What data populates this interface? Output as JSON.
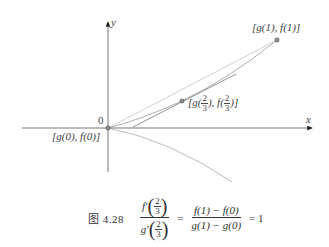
{
  "figure": {
    "axes": {
      "x_label": "x",
      "y_label": "y",
      "origin_label": "0"
    },
    "points": [
      {
        "id": "start",
        "label_prefix": "[g(0), f(0)]",
        "text": "[g(0), f(0)]",
        "px": [
          108,
          128
        ]
      },
      {
        "id": "mid",
        "text_parts": {
          "open": "[g(",
          "mid": "), f(",
          "close": ")]",
          "frac_num": "2",
          "frac_den": "3"
        },
        "px": [
          182,
          101
        ]
      },
      {
        "id": "end",
        "text": "[g(1), f(1)]",
        "px": [
          277,
          40
        ]
      }
    ],
    "curves": [
      {
        "name": "parametric-curve-upper",
        "color": "#888888"
      },
      {
        "name": "chord-line",
        "color": "#bbbbbb"
      },
      {
        "name": "tangent-line",
        "color": "#999999"
      },
      {
        "name": "lower-curve",
        "color": "#aaaaaa"
      }
    ]
  },
  "caption": {
    "figure_number": "图 4.28",
    "lhs_num_func": "f′",
    "lhs_den_func": "g′",
    "frac_num": "2",
    "frac_den": "3",
    "rhs_num": "f(1) − f(0)",
    "rhs_den": "g(1) − g(0)",
    "equals": "=",
    "result": "= 1"
  }
}
